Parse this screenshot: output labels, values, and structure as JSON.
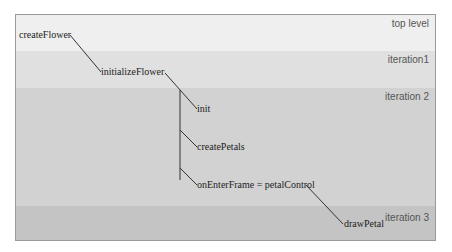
{
  "diagram": {
    "bands": [
      {
        "label": "top level",
        "color": "#efefef"
      },
      {
        "label": "iteration1",
        "color": "#e0e0e0"
      },
      {
        "label": "iteration 2",
        "color": "#d2d2d2"
      },
      {
        "label": "iteration 3",
        "color": "#c4c4c4"
      }
    ],
    "nodes": {
      "createFlower": "createFlower",
      "initializeFlower": "initializeFlower",
      "init": "init",
      "createPetals": "createPetals",
      "onEnterFrame": "onEnterFrame = petalControl",
      "drawPetal": "drawPetal"
    }
  }
}
